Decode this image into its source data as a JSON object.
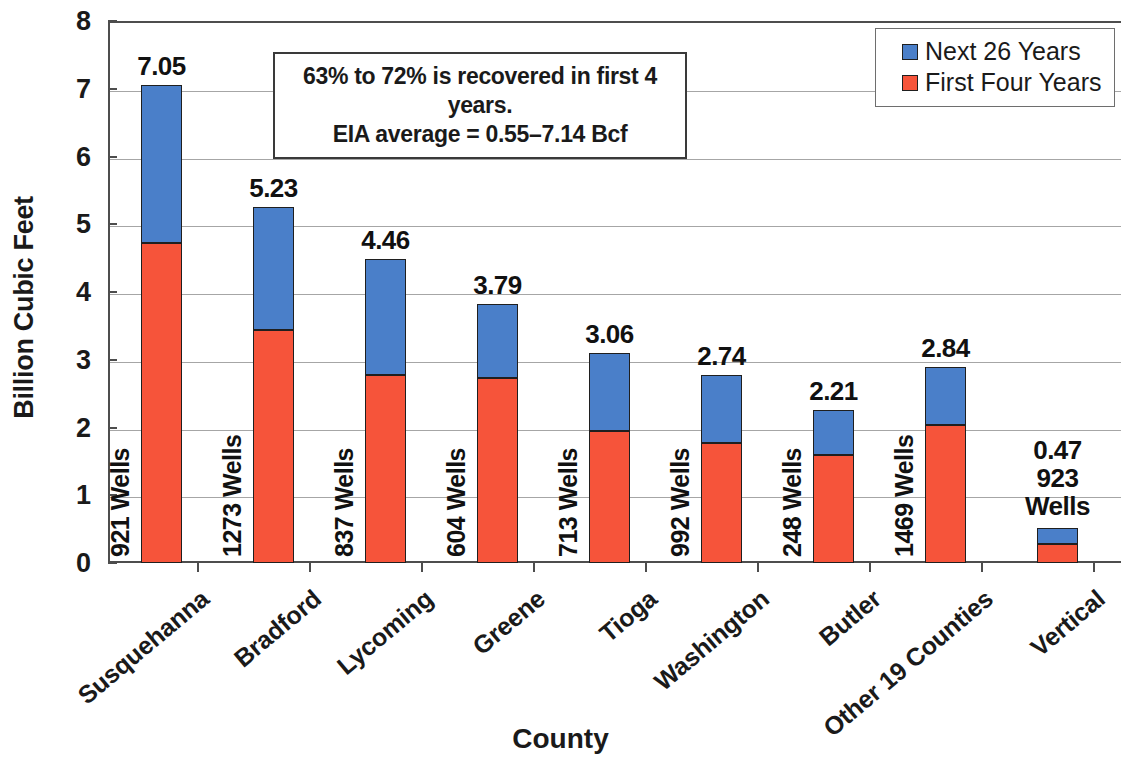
{
  "chart_data": {
    "type": "bar",
    "subtype": "stacked-bar",
    "title": "",
    "xlabel": "County",
    "ylabel": "Billion Cubic Feet",
    "ylim": [
      0,
      8
    ],
    "yticks": [
      "0",
      "1",
      "2",
      "3",
      "4",
      "5",
      "6",
      "7",
      "8"
    ],
    "grid": true,
    "legend_position": "top-right",
    "categories": [
      "Susquehanna",
      "Bradford",
      "Lycoming",
      "Greene",
      "Tioga",
      "Washington",
      "Butler",
      "Other 19 Counties",
      "Vertical"
    ],
    "series": [
      {
        "name": "First Four Years",
        "color": "#f6543a",
        "values": [
          4.72,
          3.44,
          2.78,
          2.73,
          1.95,
          1.77,
          1.6,
          2.03,
          0.28
        ]
      },
      {
        "name": "Next 26 Years",
        "color": "#4a7fc9",
        "values": [
          2.33,
          1.81,
          1.7,
          1.09,
          1.15,
          1.01,
          0.66,
          0.87,
          0.24
        ]
      }
    ],
    "totals": [
      7.05,
      5.23,
      4.46,
      3.79,
      3.06,
      2.74,
      2.21,
      2.84,
      0.47
    ],
    "total_labels": [
      "7.05",
      "5.23",
      "4.46",
      "3.79",
      "3.06",
      "2.74",
      "2.21",
      "2.84",
      "0.47"
    ],
    "well_counts": [
      921,
      1273,
      837,
      604,
      713,
      992,
      248,
      1469,
      923
    ],
    "well_labels": [
      "921 Wells",
      "1273 Wells",
      "837 Wells",
      "604 Wells",
      "713 Wells",
      "992 Wells",
      "248 Wells",
      "1469 Wells",
      "923 Wells"
    ],
    "last_bar_well_label_line1": "923",
    "last_bar_well_label_line2": "Wells",
    "annotation": {
      "line1": "63% to 72% is recovered in first 4 years.",
      "line2": "EIA average = 0.55–7.14 Bcf"
    }
  },
  "legend": {
    "items": [
      {
        "label": "Next 26 Years",
        "color": "#4a7fc9"
      },
      {
        "label": "First Four Years",
        "color": "#f6543a"
      }
    ]
  }
}
